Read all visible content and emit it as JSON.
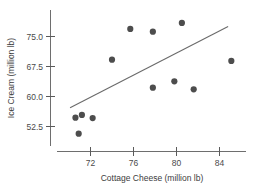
{
  "chart_data": {
    "type": "scatter",
    "title": "",
    "xlabel": "Cottage Cheese (million lb)",
    "ylabel": "Ice Cream (million lb)",
    "xlim": [
      69.5,
      86.5
    ],
    "ylim": [
      47.5,
      79.5
    ],
    "xticks": [
      72,
      76,
      80,
      84
    ],
    "xtick_labels": [
      "72",
      "76",
      "80",
      "84"
    ],
    "yticks": [
      52.5,
      60.0,
      67.5,
      75.0
    ],
    "ytick_labels": [
      "52.5",
      "60.0",
      "67.5",
      "75.0"
    ],
    "grid": false,
    "legend": null,
    "marker": "filled-circle",
    "marker_color": "#4d4d4d",
    "line_color": "#6a6a6a",
    "x": [
      70.6,
      71.2,
      72.2,
      70.9,
      74.0,
      75.7,
      77.8,
      77.8,
      79.8,
      80.5,
      81.6,
      85.1
    ],
    "y": [
      54.7,
      55.4,
      54.6,
      50.7,
      69.2,
      76.9,
      76.2,
      62.2,
      63.8,
      78.4,
      61.8,
      68.9
    ],
    "points": [
      {
        "x": 70.6,
        "y": 54.7
      },
      {
        "x": 71.2,
        "y": 55.4
      },
      {
        "x": 72.2,
        "y": 54.6
      },
      {
        "x": 70.9,
        "y": 50.7
      },
      {
        "x": 74.0,
        "y": 69.2
      },
      {
        "x": 75.7,
        "y": 76.9
      },
      {
        "x": 77.8,
        "y": 76.2
      },
      {
        "x": 77.8,
        "y": 62.2
      },
      {
        "x": 79.8,
        "y": 63.8
      },
      {
        "x": 80.5,
        "y": 78.4
      },
      {
        "x": 81.6,
        "y": 61.8
      },
      {
        "x": 85.1,
        "y": 68.9
      }
    ],
    "fit_line": {
      "type": "linear-regression",
      "x_start": 70.1,
      "y_start": 57.2,
      "x_end": 84.8,
      "y_end": 77.5
    }
  }
}
